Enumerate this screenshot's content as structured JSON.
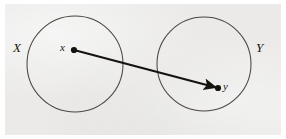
{
  "figure": {
    "kind": "set-mapping-diagram",
    "background_color": "#ffffff",
    "panel_color": "#ebeae9",
    "ink_color": "#15130f",
    "circle_stroke_color": "#4a4640",
    "width": 286,
    "height": 139
  },
  "sets": [
    {
      "id": "domain",
      "label": "X",
      "cx": 75,
      "cy": 64,
      "r": 48,
      "label_x": 13,
      "label_y": 41
    },
    {
      "id": "codomain",
      "label": "Y",
      "cx": 204,
      "cy": 64,
      "r": 47,
      "label_x": 256,
      "label_y": 41
    }
  ],
  "points": [
    {
      "id": "source-point",
      "label": "x",
      "cx": 74,
      "cy": 50,
      "r": 3.1,
      "label_x": 60,
      "label_y": 42
    },
    {
      "id": "target-point",
      "label": "y",
      "cx": 218,
      "cy": 88,
      "r": 3.1,
      "label_x": 223,
      "label_y": 81
    }
  ],
  "arrow": {
    "id": "mapping-arrow",
    "from": "source-point",
    "to": "target-point",
    "x1": 74,
    "y1": 50,
    "x2": 218,
    "y2": 88,
    "stroke_width": 2.2,
    "has_arrowhead": true
  }
}
